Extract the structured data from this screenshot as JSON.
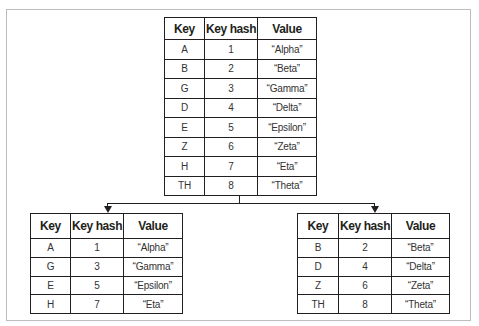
{
  "columns": [
    "Key",
    "Key hash",
    "Value"
  ],
  "tables": {
    "source": {
      "rows": [
        {
          "key": "A",
          "hash": "1",
          "value": "“Alpha”"
        },
        {
          "key": "B",
          "hash": "2",
          "value": "“Beta”"
        },
        {
          "key": "G",
          "hash": "3",
          "value": "“Gamma”"
        },
        {
          "key": "D",
          "hash": "4",
          "value": "“Delta”"
        },
        {
          "key": "E",
          "hash": "5",
          "value": "“Epsilon”"
        },
        {
          "key": "Z",
          "hash": "6",
          "value": "“Zeta”"
        },
        {
          "key": "H",
          "hash": "7",
          "value": "“Eta”"
        },
        {
          "key": "TH",
          "hash": "8",
          "value": "“Theta”"
        }
      ]
    },
    "odd": {
      "rows": [
        {
          "key": "A",
          "hash": "1",
          "value": "“Alpha”"
        },
        {
          "key": "G",
          "hash": "3",
          "value": "“Gamma”"
        },
        {
          "key": "E",
          "hash": "5",
          "value": "“Epsilon”"
        },
        {
          "key": "H",
          "hash": "7",
          "value": "“Eta”"
        }
      ]
    },
    "even": {
      "rows": [
        {
          "key": "B",
          "hash": "2",
          "value": "“Beta”"
        },
        {
          "key": "D",
          "hash": "4",
          "value": "“Delta”"
        },
        {
          "key": "Z",
          "hash": "6",
          "value": "“Zeta”"
        },
        {
          "key": "TH",
          "hash": "8",
          "value": "“Theta”"
        }
      ]
    }
  },
  "colors": {
    "line": "#231f20",
    "frame": "#bdbdbd"
  }
}
